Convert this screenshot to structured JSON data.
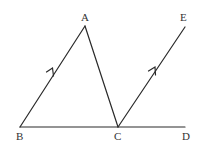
{
  "diagram": {
    "stroke_color": "#2a2a2a",
    "label_color": "#333333",
    "points": {
      "A": {
        "label": "A",
        "x": 85,
        "y": 26
      },
      "B": {
        "label": "B",
        "x": 20,
        "y": 127
      },
      "C": {
        "label": "C",
        "x": 118,
        "y": 127
      },
      "D": {
        "label": "D",
        "x": 185,
        "y": 127
      },
      "E": {
        "label": "E",
        "x": 185,
        "y": 27
      }
    },
    "segments": [
      {
        "name": "BA",
        "from": "B",
        "to": "A",
        "parallel_mark": true
      },
      {
        "name": "AC",
        "from": "A",
        "to": "C",
        "parallel_mark": false
      },
      {
        "name": "BD",
        "from": "B",
        "to": "D",
        "parallel_mark": false
      },
      {
        "name": "CE",
        "from": "C",
        "to": "E",
        "parallel_mark": true
      }
    ],
    "labels": {
      "A": "A",
      "B": "B",
      "C": "C",
      "D": "D",
      "E": "E"
    }
  }
}
